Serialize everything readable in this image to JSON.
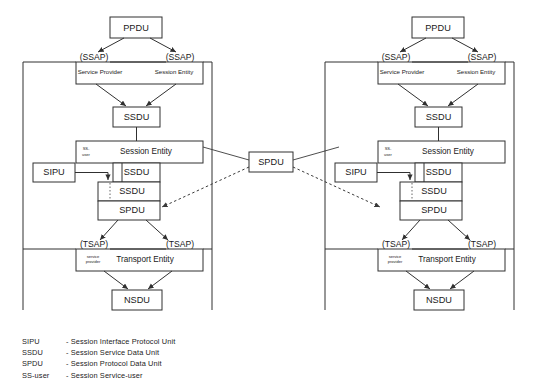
{
  "diagram": {
    "boxes": {
      "ppdu": "PPDU",
      "ssdu": "SSDU",
      "spdu": "SPDU",
      "sipu": "SIPU",
      "nsdu": "NSDU"
    },
    "sap": {
      "ssap": "(SSAP)",
      "tsap": "(TSAP)",
      "service_provider": "Service Provider",
      "session_entity": "Session Entity",
      "transport_entity": "Transport Entity",
      "service_provider_small_line1": "service",
      "service_provider_small_line2": "provider",
      "ss_user_line1": "SS-",
      "ss_user_line2": "user"
    },
    "center": {
      "spdu": "SPDU"
    },
    "legend": [
      {
        "term": "SIPU",
        "definition": "- Session Interface Protocol Unit"
      },
      {
        "term": "SSDU",
        "definition": "- Session Service Data Unit"
      },
      {
        "term": "SPDU",
        "definition": "- Session Protocol Data Unit"
      },
      {
        "term": "SS-user",
        "definition": "- Session Service-user"
      }
    ],
    "colors": {
      "stroke": "#303030",
      "background": "#ffffff",
      "text": "#1a1a1a"
    }
  }
}
